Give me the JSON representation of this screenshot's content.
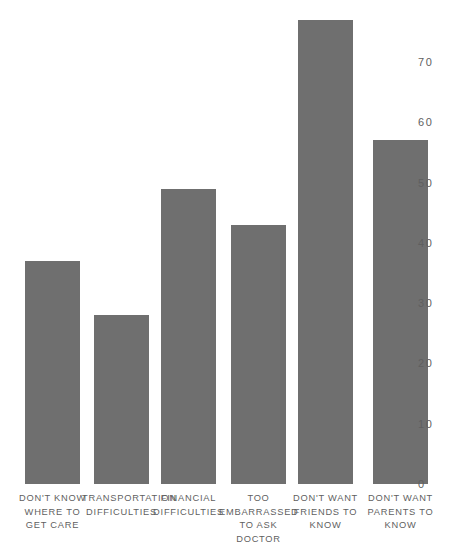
{
  "chart_data": {
    "type": "bar",
    "title": "",
    "subtitle": "",
    "xlabel": "",
    "ylabel": "",
    "grid": false,
    "legend": false,
    "legend_position": "none",
    "y_axis_position": "right",
    "ylim": [
      0,
      77
    ],
    "yticks": [
      0,
      10,
      20,
      30,
      40,
      50,
      60,
      70
    ],
    "ytick_labels": [
      "0",
      "10",
      "20",
      "30",
      "40",
      "50",
      "60",
      "70"
    ],
    "categories": [
      "DON'T KNOW\nWHERE TO\nGET CARE",
      "TRANSPORTATION\nDIFFICULTIES",
      "FINANCIAL\nDIFFICULTIES",
      "TOO\nEMBARRASSED\nTO ASK DOCTOR",
      "DON'T WANT\nFRIENDS TO\nKNOW",
      "DON'T WANT\nPARENTS TO\nKNOW"
    ],
    "values": [
      37,
      28,
      49,
      43,
      77,
      57
    ],
    "bar_color": "#6f6f6f",
    "background_color": "#ffffff",
    "text_color": "#5f5f5f"
  },
  "bars": [
    {
      "label": "DON'T KNOW\nWHERE TO\nGET CARE",
      "value": 37,
      "left": 25,
      "width": 55
    },
    {
      "label": "TRANSPORTATION\nDIFFICULTIES",
      "value": 28,
      "left": 94,
      "width": 55
    },
    {
      "label": "FINANCIAL\nDIFFICULTIES",
      "value": 49,
      "left": 161,
      "width": 55
    },
    {
      "label": "TOO\nEMBARRASSED\nTO ASK DOCTOR",
      "value": 43,
      "left": 231,
      "width": 55
    },
    {
      "label": "DON'T WANT\nFRIENDS TO\nKNOW",
      "value": 77,
      "left": 298,
      "width": 55
    },
    {
      "label": "DON'T WANT\nPARENTS TO\nKNOW",
      "value": 57,
      "left": 373,
      "width": 55
    }
  ]
}
